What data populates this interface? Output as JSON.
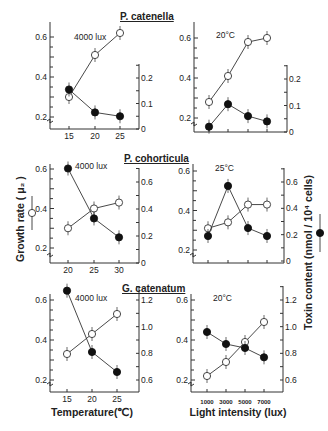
{
  "chart_data": [
    {
      "type": "line",
      "panel": "top-left",
      "species_title": "P. catenella",
      "condition": "4000 lux",
      "xlabel": "",
      "x": [
        15,
        20,
        25
      ],
      "x_tick_labels": [
        "15",
        "20",
        "25"
      ],
      "ylim_left": [
        0.2,
        0.6
      ],
      "y_left_ticks": [
        "0.2",
        "0.4",
        "0.6"
      ],
      "ylim_right": [
        0,
        0.2
      ],
      "y_right_ticks": [
        "0",
        "0.1",
        "0.2"
      ],
      "series": [
        {
          "name": "Growth rate",
          "marker": "open-circle",
          "axis": "left",
          "values": [
            0.3,
            0.51,
            0.62
          ]
        },
        {
          "name": "Toxin content",
          "marker": "filled-circle",
          "axis": "right",
          "values": [
            0.155,
            0.065,
            0.05
          ]
        }
      ]
    },
    {
      "type": "line",
      "panel": "top-right",
      "species_title": "",
      "condition": "20°C",
      "xlabel": "",
      "x": [
        1000,
        3000,
        5000,
        7000
      ],
      "x_tick_labels": [],
      "ylim_left": [
        0.2,
        0.6
      ],
      "y_left_ticks": [
        "0.2",
        "0.4",
        "0.6"
      ],
      "ylim_right": [
        0,
        0.2
      ],
      "y_right_ticks": [
        "0",
        "0.1",
        "0.2"
      ],
      "series": [
        {
          "name": "Growth rate",
          "marker": "open-circle",
          "axis": "left",
          "values": [
            0.28,
            0.41,
            0.58,
            0.6
          ]
        },
        {
          "name": "Toxin content",
          "marker": "filled-circle",
          "axis": "right",
          "values": [
            0.02,
            0.105,
            0.06,
            0.04
          ]
        }
      ]
    },
    {
      "type": "line",
      "panel": "middle-left",
      "species_title": "P. cohorticula",
      "condition": "4000 lux",
      "xlabel": "",
      "x": [
        20,
        25,
        30
      ],
      "x_tick_labels": [
        "20",
        "25",
        "30"
      ],
      "ylim_left": [
        0.2,
        0.6
      ],
      "y_left_ticks": [
        "0.2",
        "0.4",
        "0.6"
      ],
      "ylim_right": [
        0,
        0.6
      ],
      "y_right_ticks": [
        "0",
        "0.2",
        "0.4",
        "0.6"
      ],
      "series": [
        {
          "name": "Growth rate",
          "marker": "open-circle",
          "axis": "left",
          "values": [
            0.3,
            0.4,
            0.43
          ]
        },
        {
          "name": "Toxin content",
          "marker": "filled-circle",
          "axis": "right",
          "values": [
            0.7,
            0.33,
            0.19
          ]
        }
      ]
    },
    {
      "type": "line",
      "panel": "middle-right",
      "species_title": "",
      "condition": "25°C",
      "xlabel": "",
      "x": [
        1000,
        3000,
        5000,
        7000
      ],
      "x_tick_labels": [],
      "ylim_left": [
        0.2,
        0.6
      ],
      "y_left_ticks": [
        "0.2",
        "0.4",
        "0.6"
      ],
      "ylim_right": [
        0,
        0.6
      ],
      "y_right_ticks": [
        "0",
        "0.2",
        "0.4",
        "0.6"
      ],
      "series": [
        {
          "name": "Growth rate",
          "marker": "open-circle",
          "axis": "left",
          "values": [
            0.31,
            0.34,
            0.43,
            0.43
          ]
        },
        {
          "name": "Toxin content",
          "marker": "filled-circle",
          "axis": "right",
          "values": [
            0.19,
            0.57,
            0.25,
            0.19
          ]
        }
      ]
    },
    {
      "type": "line",
      "panel": "bottom-left",
      "species_title": "G. catenatum",
      "condition": "4000 lux",
      "xlabel": "Temperature(℃)",
      "x": [
        15,
        20,
        25
      ],
      "x_tick_labels": [
        "15",
        "20",
        "25"
      ],
      "ylim_left": [
        0.2,
        0.6
      ],
      "y_left_ticks": [
        "0.2",
        "0.4",
        "0.6"
      ],
      "ylim_right": [
        0.6,
        1.2
      ],
      "y_right_ticks": [
        "0.6",
        "0.8",
        "1.0",
        "1.2"
      ],
      "series": [
        {
          "name": "Growth rate",
          "marker": "open-circle",
          "axis": "left",
          "values": [
            0.33,
            0.43,
            0.53
          ]
        },
        {
          "name": "Toxin content",
          "marker": "filled-circle",
          "axis": "right",
          "values": [
            1.27,
            0.81,
            0.66
          ]
        }
      ]
    },
    {
      "type": "line",
      "panel": "bottom-right",
      "species_title": "",
      "condition": "20°C",
      "xlabel": "Light intensity (lux)",
      "x": [
        1000,
        3000,
        5000,
        7000
      ],
      "x_tick_labels": [
        "1000",
        "3000",
        "5000",
        "7000"
      ],
      "ylim_left": [
        0.2,
        0.6
      ],
      "y_left_ticks": [
        "0.2",
        "0.4",
        "0.6"
      ],
      "ylim_right": [
        0.6,
        1.2
      ],
      "y_right_ticks": [
        "0.6",
        "0.8",
        "1.0",
        "1.2"
      ],
      "series": [
        {
          "name": "Growth rate",
          "marker": "open-circle",
          "axis": "left",
          "values": [
            0.22,
            0.29,
            0.39,
            0.49
          ]
        },
        {
          "name": "Toxin content",
          "marker": "filled-circle",
          "axis": "right",
          "values": [
            0.96,
            0.87,
            0.84,
            0.77
          ]
        }
      ]
    }
  ],
  "labels": {
    "y_left_title": "Growth rate ( μ₂ )",
    "y_right_title": "Toxin content (nmol / 10⁴ cells)",
    "x_bottom_left_title": "Temperature(℃)",
    "x_bottom_right_title": "Light intensity (lux)"
  }
}
